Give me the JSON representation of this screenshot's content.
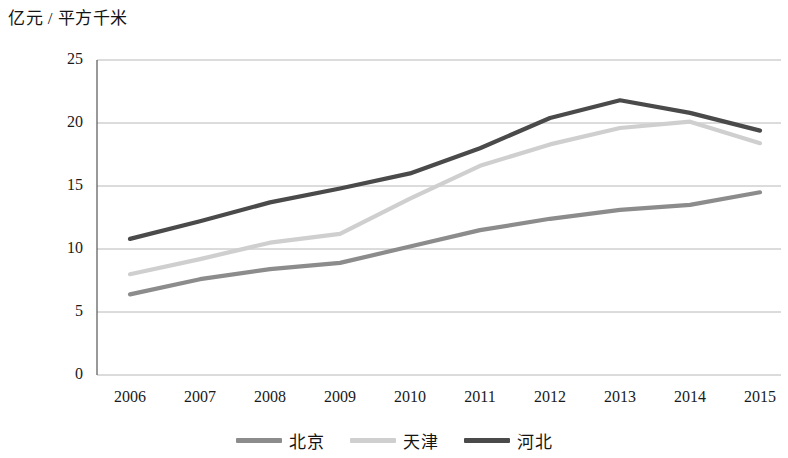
{
  "chart_data": {
    "type": "line",
    "title": "",
    "subtitle": "",
    "xlabel": "",
    "ylabel": "亿元 / 平方千米",
    "categories": [
      "2006",
      "2007",
      "2008",
      "2009",
      "2010",
      "2011",
      "2012",
      "2013",
      "2014",
      "2015"
    ],
    "series": [
      {
        "name": "北京",
        "color": "#8c8c8c",
        "values": [
          6.4,
          7.6,
          8.4,
          8.9,
          10.2,
          11.5,
          12.4,
          13.1,
          13.5,
          14.5
        ]
      },
      {
        "name": "天津",
        "color": "#cfcfcf",
        "values": [
          8.0,
          9.2,
          10.5,
          11.2,
          14.0,
          16.6,
          18.3,
          19.6,
          20.1,
          18.4
        ]
      },
      {
        "name": "河北",
        "color": "#4a4a4a",
        "values": [
          10.8,
          12.2,
          13.7,
          14.8,
          16.0,
          18.0,
          20.4,
          21.8,
          20.8,
          19.4
        ]
      }
    ],
    "ylim": [
      0,
      25
    ],
    "yticks": [
      0,
      5,
      10,
      15,
      20,
      25
    ],
    "ytick_labels": [
      "0",
      "5",
      "10",
      "15",
      "20",
      "25"
    ],
    "grid": "horizontal",
    "legend_position": "bottom"
  },
  "axis": {
    "unit_label": "亿元 / 平方千米"
  },
  "colors": {
    "beijing": "#8c8c8c",
    "tianjin": "#cfcfcf",
    "hebei": "#4a4a4a",
    "gridline": "#b8b8b8",
    "axis": "#555555",
    "text": "#1a1a1a"
  }
}
